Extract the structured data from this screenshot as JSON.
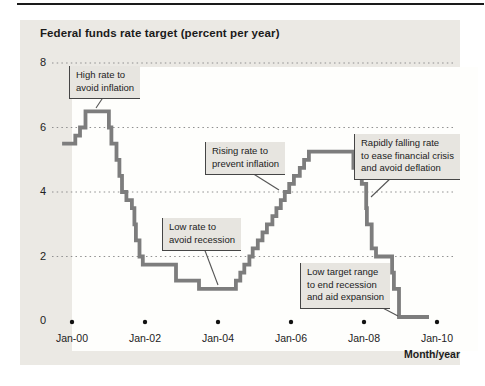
{
  "colors": {
    "top_rule": "#1a1a1a",
    "panel_bg": "#ebe9e4",
    "plot_bg": "#fefefc",
    "line": "#7d7d7d",
    "grid": "#8f8f8f",
    "annotation_bg": "#e7e5e0",
    "annotation_border": "#454545",
    "text": "#1b1b1b",
    "tick_dot": "#111111"
  },
  "chart": {
    "title": "Federal funds rate target (percent per year)",
    "x_axis": {
      "label": "Month/year",
      "ticks": [
        {
          "label": "Jan-00",
          "year": 2000
        },
        {
          "label": "Jan-02",
          "year": 2002
        },
        {
          "label": "Jan-04",
          "year": 2004
        },
        {
          "label": "Jan-06",
          "year": 2006
        },
        {
          "label": "Jan-08",
          "year": 2008
        },
        {
          "label": "Jan-10",
          "year": 2010
        }
      ]
    },
    "y_axis": {
      "ticks": [
        {
          "label": "8",
          "value": 8
        },
        {
          "label": "6",
          "value": 6
        },
        {
          "label": "4",
          "value": 4
        },
        {
          "label": "2",
          "value": 2
        },
        {
          "label": "0",
          "value": 0
        }
      ]
    },
    "annotations": [
      {
        "id": "high-rate",
        "text": "High rate to\navoid inflation",
        "left": 69,
        "top": 66,
        "leader": {
          "x1": 104,
          "y1": 96,
          "x2": 96,
          "y2": 108
        }
      },
      {
        "id": "rising-rate",
        "text": "Rising rate to\nprevent inflation",
        "left": 205,
        "top": 142,
        "leader": {
          "x1": 252,
          "y1": 173,
          "x2": 279,
          "y2": 190
        }
      },
      {
        "id": "low-rate",
        "text": "Low rate to\navoid recession",
        "left": 162,
        "top": 218,
        "leader": {
          "x1": 204,
          "y1": 248,
          "x2": 218,
          "y2": 285
        }
      },
      {
        "id": "rapidly-falling",
        "text": "Rapidly falling rate\nto ease financial crisis\nand avoid deflation",
        "left": 354,
        "top": 134,
        "leader": {
          "x1": 393,
          "y1": 176,
          "x2": 371,
          "y2": 197
        }
      },
      {
        "id": "low-target",
        "text": "Low target range\nto end recession\nand aid expansion",
        "left": 300,
        "top": 263,
        "leader": {
          "x1": 379,
          "y1": 306,
          "x2": 398,
          "y2": 316
        }
      }
    ]
  },
  "chart_data": {
    "type": "line",
    "line_style": "step-post",
    "title": "Federal funds rate target (percent per year)",
    "xlabel": "Month/year",
    "ylabel": "Federal funds rate target (percent per year)",
    "xlim": [
      1999.45,
      2010.55
    ],
    "ylim": [
      0,
      8.5
    ],
    "y_ticks": [
      0,
      2,
      4,
      6,
      8
    ],
    "x_tick_labels": [
      "Jan-00",
      "Jan-02",
      "Jan-04",
      "Jan-06",
      "Jan-08",
      "Jan-10"
    ],
    "grid": "dotted-horizontal",
    "legend": "none",
    "series": [
      {
        "name": "Federal funds rate target",
        "color": "#7d7d7d",
        "points": [
          [
            1999.73,
            5.5
          ],
          [
            2000.09,
            5.75
          ],
          [
            2000.22,
            6.0
          ],
          [
            2000.37,
            6.5
          ],
          [
            2001.01,
            6.0
          ],
          [
            2001.08,
            5.5
          ],
          [
            2001.22,
            5.0
          ],
          [
            2001.3,
            4.5
          ],
          [
            2001.37,
            4.0
          ],
          [
            2001.49,
            3.75
          ],
          [
            2001.64,
            3.5
          ],
          [
            2001.71,
            3.0
          ],
          [
            2001.75,
            2.5
          ],
          [
            2001.85,
            2.0
          ],
          [
            2001.94,
            1.75
          ],
          [
            2002.85,
            1.25
          ],
          [
            2003.48,
            1.0
          ],
          [
            2004.49,
            1.25
          ],
          [
            2004.61,
            1.5
          ],
          [
            2004.72,
            1.75
          ],
          [
            2004.86,
            2.0
          ],
          [
            2004.95,
            2.25
          ],
          [
            2005.09,
            2.5
          ],
          [
            2005.22,
            2.75
          ],
          [
            2005.34,
            3.0
          ],
          [
            2005.49,
            3.25
          ],
          [
            2005.6,
            3.5
          ],
          [
            2005.72,
            3.75
          ],
          [
            2005.83,
            4.0
          ],
          [
            2005.95,
            4.25
          ],
          [
            2006.08,
            4.5
          ],
          [
            2006.24,
            4.75
          ],
          [
            2006.36,
            5.0
          ],
          [
            2006.49,
            5.25
          ],
          [
            2007.71,
            4.75
          ],
          [
            2007.83,
            4.5
          ],
          [
            2007.94,
            4.25
          ],
          [
            2008.06,
            3.5
          ],
          [
            2008.08,
            3.0
          ],
          [
            2008.21,
            2.25
          ],
          [
            2008.33,
            2.0
          ],
          [
            2008.77,
            1.5
          ],
          [
            2008.82,
            1.0
          ],
          [
            2008.96,
            0.125
          ],
          [
            2009.78,
            0.125
          ]
        ]
      }
    ],
    "annotations": [
      "High rate to avoid inflation",
      "Rising rate to prevent inflation",
      "Low rate to avoid recession",
      "Rapidly falling rate to ease financial crisis and avoid deflation",
      "Low target range to end recession and aid expansion"
    ]
  }
}
